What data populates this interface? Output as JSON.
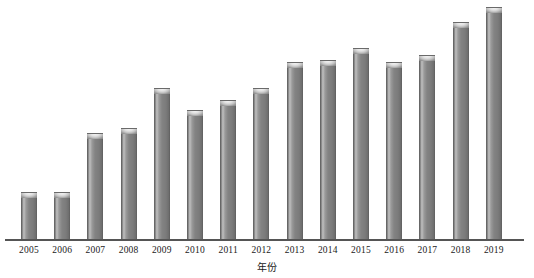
{
  "chart_data": {
    "type": "bar",
    "title": "",
    "subtitle": "",
    "xlabel": "年份",
    "ylabel": "",
    "categories": [
      "2005",
      "2006",
      "2007",
      "2008",
      "2009",
      "2010",
      "2011",
      "2012",
      "2013",
      "2014",
      "2015",
      "2016",
      "2017",
      "2018",
      "2019"
    ],
    "values": [
      48,
      48,
      107,
      112,
      152,
      130,
      140,
      152,
      178,
      180,
      192,
      178,
      185,
      218,
      233
    ],
    "series": [
      {
        "name": "数量",
        "values": [
          48,
          48,
          107,
          112,
          152,
          130,
          140,
          152,
          178,
          180,
          192,
          178,
          185,
          218,
          233
        ]
      }
    ],
    "ylim": [
      0,
      240
    ],
    "grid": false,
    "legend": "none",
    "axis_visible": {
      "x": true,
      "y": false
    },
    "tick_labels": {
      "x": [
        "2005",
        "2006",
        "2007",
        "2008",
        "2009",
        "2010",
        "2011",
        "2012",
        "2013",
        "2014",
        "2015",
        "2016",
        "2017",
        "2018",
        "2019"
      ],
      "y": []
    },
    "colors": {
      "bar_fill": "#7b7b7b",
      "bar_highlight": "#bdbdbd",
      "bar_edge": "#5a5a5a",
      "bar_cap": "#e2e2e2",
      "axis": "#555555",
      "background": "#ffffff",
      "text": "#1a1a1a"
    },
    "annotations": []
  }
}
